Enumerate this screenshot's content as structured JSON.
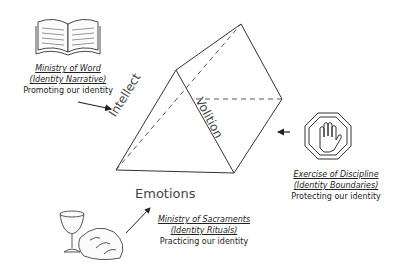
{
  "prism": {
    "faces": {
      "left": "Intellect",
      "right": "Volition",
      "bottom": "Emotions"
    }
  },
  "nodes": [
    {
      "id": "word",
      "icon": "open-book-icon",
      "title": "Ministry of Word",
      "subtitle": "(Identity Narrative)",
      "purpose": "Promoting our identity"
    },
    {
      "id": "discipline",
      "icon": "stop-hand-icon",
      "title": "Exercise of Discipline",
      "subtitle": "(Identity Boundaries)",
      "purpose": "Protecting our identity"
    },
    {
      "id": "sacraments",
      "icon": "chalice-bread-icon",
      "title": "Ministry of Sacraments",
      "subtitle": "(Identity Rituals)",
      "purpose": "Practicing our identity"
    }
  ],
  "colors": {
    "line": "#222222",
    "background": "#ffffff"
  }
}
